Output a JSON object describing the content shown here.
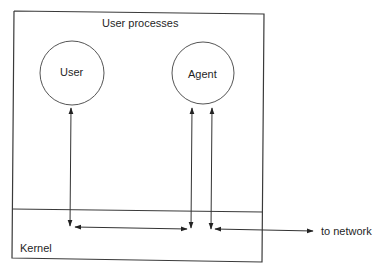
{
  "diagram": {
    "type": "process-architecture",
    "regions": {
      "user_space_label": "User processes",
      "kernel_label": "Kernel"
    },
    "nodes": [
      {
        "id": "user",
        "label": "User",
        "shape": "circle"
      },
      {
        "id": "agent",
        "label": "Agent",
        "shape": "circle"
      }
    ],
    "external": {
      "network_label": "to network"
    },
    "edges": [
      {
        "from": "user",
        "to": "kernel",
        "direction": "bidirectional"
      },
      {
        "from": "agent",
        "to": "kernel",
        "direction": "bidirectional",
        "instance": 1
      },
      {
        "from": "agent",
        "to": "kernel",
        "direction": "bidirectional",
        "instance": 2
      },
      {
        "from": "user-kernel-endpoint",
        "to": "agent-kernel-endpoint",
        "direction": "bidirectional",
        "layer": "kernel"
      },
      {
        "from": "agent-kernel-endpoint",
        "to": "network",
        "direction": "bidirectional",
        "layer": "kernel"
      }
    ],
    "colors": {
      "stroke": "#333333",
      "text": "#1f1f1f",
      "background": "#ffffff"
    }
  }
}
